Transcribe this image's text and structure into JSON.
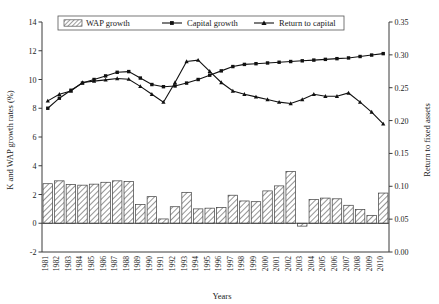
{
  "chart_data": {
    "type": "bar",
    "title": "",
    "subtitle": "",
    "xlabel": "Years",
    "ylabel": "K and WAP growth rates (%)",
    "y2label": "Return to fixed assets",
    "ylim": [
      -2,
      14
    ],
    "y2lim": [
      0.0,
      0.35
    ],
    "ytick_labels": [
      "-2",
      "0",
      "2",
      "4",
      "6",
      "8",
      "10",
      "12",
      "14"
    ],
    "ytick_values": [
      -2,
      0,
      2,
      4,
      6,
      8,
      10,
      12,
      14
    ],
    "y2tick_labels": [
      "0.00",
      "0.05",
      "0.10",
      "0.15",
      "0.20",
      "0.25",
      "0.30",
      "0.35"
    ],
    "y2tick_values": [
      0.0,
      0.05,
      0.1,
      0.15,
      0.2,
      0.25,
      0.3,
      0.35
    ],
    "grid": false,
    "legend_position": "top",
    "categories": [
      "1981",
      "1982",
      "1983",
      "1984",
      "1985",
      "1986",
      "1987",
      "1988",
      "1989",
      "1990",
      "1991",
      "1992",
      "1993",
      "1994",
      "1995",
      "1996",
      "1997",
      "1998",
      "1999",
      "2000",
      "2001",
      "2002",
      "2003",
      "2004",
      "2005",
      "2006",
      "2007",
      "2008",
      "2009",
      "2010"
    ],
    "series": [
      {
        "name": "WAP growth",
        "type": "bar",
        "axis": "left",
        "marker": "hatched-bar",
        "values": [
          2.75,
          2.95,
          2.7,
          2.65,
          2.72,
          2.85,
          2.95,
          2.9,
          1.3,
          1.85,
          0.3,
          1.15,
          2.15,
          1.0,
          1.05,
          1.1,
          1.95,
          1.55,
          1.5,
          2.25,
          2.6,
          3.6,
          -0.2,
          1.65,
          1.75,
          1.7,
          1.25,
          0.95,
          0.55,
          2.1
        ]
      },
      {
        "name": "Capital growth",
        "type": "line",
        "axis": "left",
        "marker": "square",
        "values": [
          8.0,
          8.7,
          9.25,
          9.75,
          10.0,
          10.25,
          10.5,
          10.55,
          10.1,
          9.65,
          9.5,
          9.55,
          9.75,
          10.0,
          10.3,
          10.6,
          10.9,
          11.05,
          11.1,
          11.15,
          11.2,
          11.25,
          11.3,
          11.35,
          11.4,
          11.45,
          11.5,
          11.6,
          11.7,
          11.8
        ]
      },
      {
        "name": "Return to capital",
        "type": "line",
        "axis": "right",
        "marker": "triangle",
        "values": [
          0.23,
          0.24,
          0.245,
          0.258,
          0.26,
          0.262,
          0.264,
          0.263,
          0.252,
          0.24,
          0.228,
          0.258,
          0.29,
          0.292,
          0.275,
          0.258,
          0.245,
          0.24,
          0.236,
          0.232,
          0.228,
          0.226,
          0.232,
          0.24,
          0.237,
          0.237,
          0.242,
          0.228,
          0.213,
          0.195
        ]
      }
    ]
  },
  "legend": {
    "items": [
      {
        "label": "WAP growth",
        "marker": "hatched-swatch"
      },
      {
        "label": "Capital growth",
        "marker": "line-square"
      },
      {
        "label": "Return to capital",
        "marker": "line-triangle"
      }
    ]
  },
  "axes": {
    "left_title": "K and WAP growth rates (%)",
    "right_title": "Return to fixed assets",
    "bottom_title": "Years"
  },
  "colors": {
    "axis": "#3a3a3a",
    "line": "#111111",
    "bar_edge": "#3f3f3f",
    "hatch": "#6e6e6e",
    "background": "#ffffff"
  }
}
